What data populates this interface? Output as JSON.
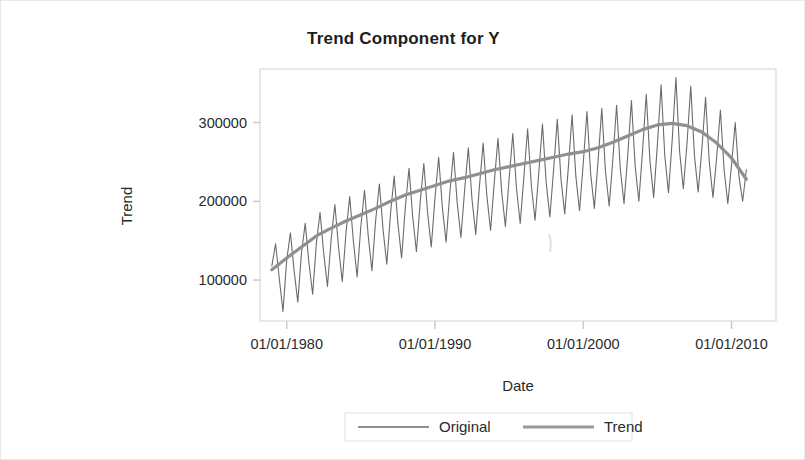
{
  "chart_data": {
    "type": "line",
    "title": "Trend Component for Y",
    "xlabel": "Date",
    "ylabel": "Trend",
    "grid": false,
    "legend_position": "bottom",
    "xtick_labels": [
      "01/01/1980",
      "01/01/1990",
      "01/01/2000",
      "01/01/2010"
    ],
    "xtick_values": [
      1980,
      1990,
      2000,
      2010
    ],
    "ytick_labels": [
      "100000",
      "200000",
      "300000"
    ],
    "ytick_values": [
      100000,
      200000,
      300000
    ],
    "xlim": [
      1978.2,
      2013.0
    ],
    "ylim": [
      48000,
      368000
    ],
    "series": [
      {
        "name": "Original",
        "color": "#6b6b6b",
        "width": 1.1,
        "x": [
          1979.0,
          1979.25,
          1979.5,
          1979.75,
          1980.0,
          1980.25,
          1980.5,
          1980.75,
          1981.0,
          1981.25,
          1981.5,
          1981.75,
          1982.0,
          1982.25,
          1982.5,
          1982.75,
          1983.0,
          1983.25,
          1983.5,
          1983.75,
          1984.0,
          1984.25,
          1984.5,
          1984.75,
          1985.0,
          1985.25,
          1985.5,
          1985.75,
          1986.0,
          1986.25,
          1986.5,
          1986.75,
          1987.0,
          1987.25,
          1987.5,
          1987.75,
          1988.0,
          1988.25,
          1988.5,
          1988.75,
          1989.0,
          1989.25,
          1989.5,
          1989.75,
          1990.0,
          1990.25,
          1990.5,
          1990.75,
          1991.0,
          1991.25,
          1991.5,
          1991.75,
          1992.0,
          1992.25,
          1992.5,
          1992.75,
          1993.0,
          1993.25,
          1993.5,
          1993.75,
          1994.0,
          1994.25,
          1994.5,
          1994.75,
          1995.0,
          1995.25,
          1995.5,
          1995.75,
          1996.0,
          1996.25,
          1996.5,
          1996.75,
          1997.0,
          1997.25,
          1997.5,
          1997.75,
          1998.0,
          1998.25,
          1998.5,
          1998.75,
          1999.0,
          1999.25,
          1999.5,
          1999.75,
          2000.0,
          2000.25,
          2000.5,
          2000.75,
          2001.0,
          2001.25,
          2001.5,
          2001.75,
          2002.0,
          2002.25,
          2002.5,
          2002.75,
          2003.0,
          2003.25,
          2003.5,
          2003.75,
          2004.0,
          2004.25,
          2004.5,
          2004.75,
          2005.0,
          2005.25,
          2005.5,
          2005.75,
          2006.0,
          2006.25,
          2006.5,
          2006.75,
          2007.0,
          2007.25,
          2007.5,
          2007.75,
          2008.0,
          2008.25,
          2008.5,
          2008.75,
          2009.0,
          2009.25,
          2009.5,
          2009.75,
          2010.0,
          2010.25,
          2010.5,
          2010.75,
          2011.0
        ],
        "y": [
          118000,
          146000,
          102000,
          60000,
          125000,
          160000,
          112000,
          72000,
          135000,
          172000,
          122000,
          82000,
          146000,
          186000,
          133000,
          92000,
          152000,
          196000,
          141000,
          98000,
          160000,
          206000,
          149000,
          104000,
          168000,
          214000,
          156000,
          112000,
          176000,
          222000,
          164000,
          120000,
          184000,
          232000,
          172000,
          128000,
          192000,
          242000,
          180000,
          136000,
          198000,
          248000,
          186000,
          142000,
          204000,
          256000,
          192000,
          148000,
          210000,
          262000,
          198000,
          154000,
          214000,
          268000,
          202000,
          158000,
          219000,
          274000,
          207000,
          163000,
          224000,
          280000,
          212000,
          168000,
          228000,
          286000,
          216000,
          172000,
          232000,
          292000,
          220000,
          176000,
          236000,
          298000,
          224000,
          180000,
          240000,
          304000,
          228000,
          184000,
          244000,
          310000,
          232000,
          188000,
          248000,
          314000,
          235000,
          191000,
          251000,
          318000,
          238000,
          194000,
          254000,
          322000,
          241000,
          197000,
          258000,
          328000,
          245000,
          200000,
          264000,
          336000,
          251000,
          205000,
          272000,
          348000,
          258000,
          211000,
          278000,
          357000,
          263000,
          216000,
          274000,
          346000,
          258000,
          212000,
          266000,
          332000,
          250000,
          205000,
          256000,
          316000,
          240000,
          197000,
          246000,
          300000,
          232000,
          200000,
          240000
        ]
      },
      {
        "name": "Trend",
        "color": "#909090",
        "width": 3.2,
        "x": [
          1979.0,
          1980.0,
          1981.0,
          1982.0,
          1983.0,
          1984.0,
          1985.0,
          1986.0,
          1987.0,
          1988.0,
          1989.0,
          1990.0,
          1991.0,
          1992.0,
          1993.0,
          1994.0,
          1995.0,
          1996.0,
          1997.0,
          1998.0,
          1999.0,
          2000.0,
          2001.0,
          2002.0,
          2003.0,
          2004.0,
          2005.0,
          2006.0,
          2007.0,
          2008.0,
          2009.0,
          2010.0,
          2011.0
        ],
        "y": [
          113000,
          128000,
          142000,
          156000,
          166000,
          175000,
          183000,
          191000,
          200000,
          208000,
          214000,
          220000,
          226000,
          230000,
          235000,
          240000,
          244000,
          248000,
          252000,
          256000,
          260000,
          263000,
          268000,
          275000,
          283000,
          291000,
          297000,
          299000,
          296000,
          288000,
          274000,
          255000,
          228000
        ]
      }
    ]
  },
  "legend": {
    "entries": [
      {
        "label": "Original",
        "color": "#6b6b6b"
      },
      {
        "label": "Trend",
        "color": "#9a9a9a"
      }
    ]
  }
}
